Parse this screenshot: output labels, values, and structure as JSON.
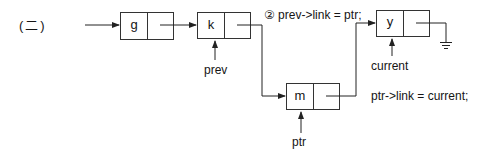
{
  "section_label": "(二)",
  "colors": {
    "stroke": "#222222",
    "node_fill": "#ffffff",
    "text": "#151515"
  },
  "nodes": [
    {
      "id": "g",
      "data": "g"
    },
    {
      "id": "k",
      "data": "k"
    },
    {
      "id": "y",
      "data": "y"
    },
    {
      "id": "m",
      "data": "m"
    }
  ],
  "pointers": {
    "prev": "prev",
    "current": "current",
    "ptr": "ptr"
  },
  "statements": {
    "step2": "② prev->link = ptr;",
    "ptr_link": "ptr->link  =  current;"
  },
  "null_terminator": "ground-symbol"
}
